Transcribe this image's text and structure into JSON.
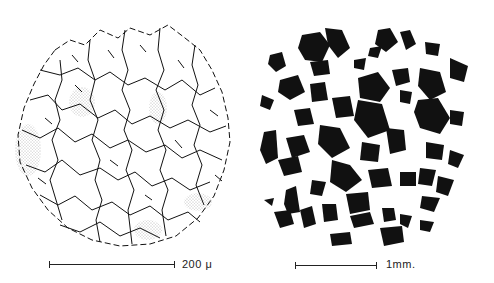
{
  "figure": {
    "panels": [
      {
        "id": "left",
        "description": "Line drawing of grain boundary network in circular field, with stippled regions",
        "scale_bar": {
          "label": "200 μ"
        }
      },
      {
        "id": "right",
        "description": "Black silhouette particles in circular field",
        "scale_bar": {
          "label": "1mm."
        }
      }
    ],
    "colors": {
      "ink": "#111111",
      "background": "#ffffff",
      "stipple": "#777777"
    }
  }
}
